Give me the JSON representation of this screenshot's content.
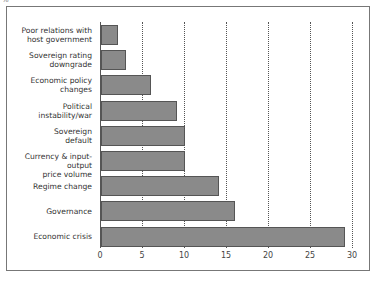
{
  "corner_label": "%",
  "chart_data": {
    "type": "bar",
    "orientation": "horizontal",
    "title": "",
    "xlabel": "",
    "ylabel": "",
    "categories": [
      "Poor relations with host government",
      "Sovereign rating downgrade",
      "Economic policy changes",
      "Political instability/war",
      "Sovereign default",
      "Currency & input-output price volume",
      "Regime change",
      "Governance",
      "Economic crisis"
    ],
    "values": [
      2,
      3,
      6,
      9,
      10,
      10,
      14,
      16,
      29
    ],
    "xlim": [
      0,
      30
    ],
    "xticks": [
      0,
      5,
      10,
      15,
      20,
      25,
      30
    ],
    "grid": "vertical dotted",
    "legend": "none",
    "bar_color": "#8a8a8a"
  },
  "labels": [
    "Poor relations with\nhost government",
    "Sovereign rating\ndowngrade",
    "Economic policy\nchanges",
    "Political\ninstability/war",
    "Sovereign\ndefault",
    "Currency & input-output\nprice volume",
    "Regime change",
    "Governance",
    "Economic crisis"
  ],
  "ticks": [
    "0",
    "5",
    "10",
    "15",
    "20",
    "25",
    "30"
  ]
}
